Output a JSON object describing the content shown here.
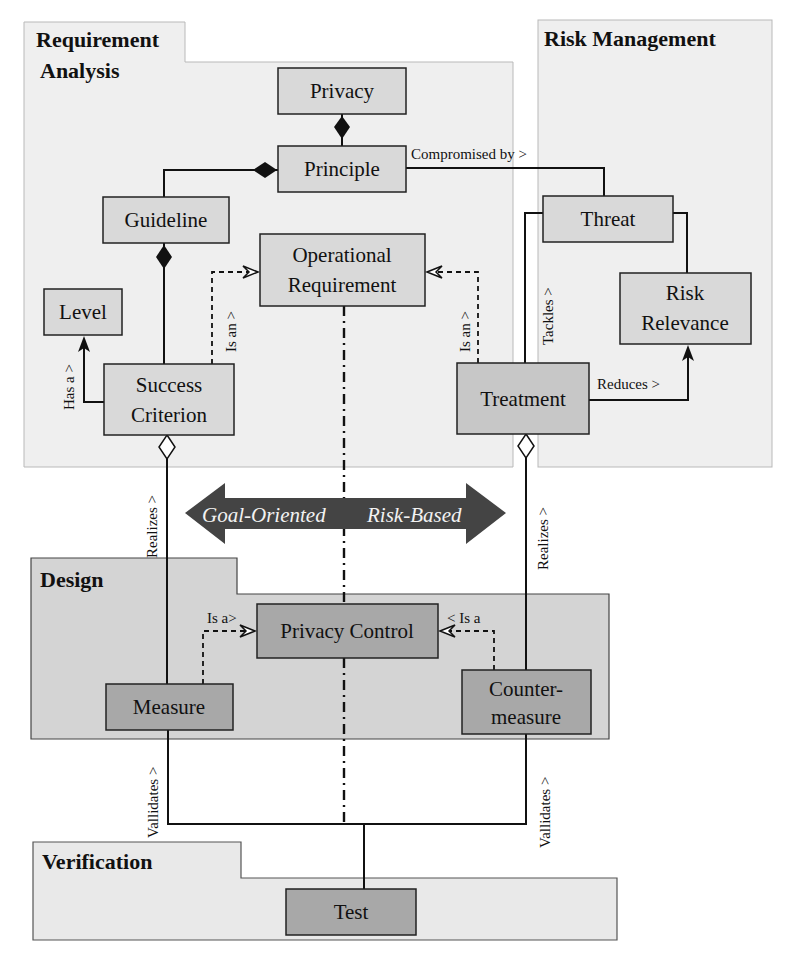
{
  "packages": {
    "requirement_analysis": {
      "title_line1": "Requirement",
      "title_line2": "Analysis"
    },
    "risk_management": {
      "title": "Risk Management"
    },
    "design": {
      "title": "Design"
    },
    "verification": {
      "title": "Verification"
    }
  },
  "nodes": {
    "privacy": "Privacy",
    "principle": "Principle",
    "guideline": "Guideline",
    "operational_requirement": {
      "line1": "Operational",
      "line2": "Requirement"
    },
    "level": "Level",
    "success_criterion": {
      "line1": "Success",
      "line2": "Criterion"
    },
    "threat": "Threat",
    "risk_relevance": {
      "line1": "Risk",
      "line2": "Relevance"
    },
    "treatment": "Treatment",
    "privacy_control": "Privacy Control",
    "measure": "Measure",
    "countermeasure": {
      "line1": "Counter-",
      "line2": "measure"
    },
    "test": "Test"
  },
  "edges": {
    "compromised_by": "Compromised by >",
    "is_an_left": "Is an >",
    "is_an_right": "Is an >",
    "has_a": "Has a >",
    "tackles": "Tackles >",
    "reduces": "Reduces >",
    "realizes_left": "Realizes >",
    "realizes_right": "Realizes >",
    "is_a_left": "Is a>",
    "is_a_right": "< Is a",
    "validates_left": "Vallidates >",
    "validates_right": "Vallidates >"
  },
  "spectrum_arrow": {
    "left_label": "Goal-Oriented",
    "right_label": "Risk-Based",
    "color": "#444444"
  },
  "colors": {
    "package_light": "#efefef",
    "package_design": "#d4d4d4",
    "node_light": "#d9d9d9",
    "node_dark": "#a8a8a8"
  }
}
